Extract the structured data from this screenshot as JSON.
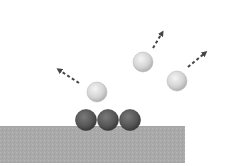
{
  "diagram": {
    "colors": {
      "background": "#ffffff",
      "substrate": "#a9a9a9",
      "adsorbed_atom": "#555555",
      "desorbed_atom": "#d6d6d6",
      "arrow": "#444444"
    },
    "substrate": {
      "x": 0,
      "y": 126,
      "width": 185,
      "height": 37
    },
    "adsorbed_atoms": [
      {
        "cx": 86,
        "cy": 120,
        "r": 10.5
      },
      {
        "cx": 108,
        "cy": 120,
        "r": 10.5
      },
      {
        "cx": 130,
        "cy": 120,
        "r": 10.5
      }
    ],
    "desorbed_atoms": [
      {
        "cx": 97,
        "cy": 92,
        "r": 10
      },
      {
        "cx": 143,
        "cy": 62,
        "r": 10
      },
      {
        "cx": 177,
        "cy": 81,
        "r": 10
      }
    ],
    "arrows": [
      {
        "x1": 79,
        "y1": 83,
        "x2": 59,
        "y2": 70
      },
      {
        "x1": 153,
        "y1": 48,
        "x2": 162,
        "y2": 33
      },
      {
        "x1": 188,
        "y1": 67,
        "x2": 205,
        "y2": 53
      }
    ]
  }
}
